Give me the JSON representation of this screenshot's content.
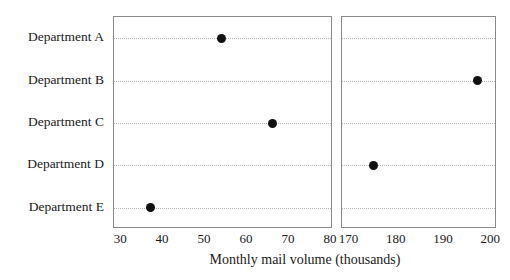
{
  "chart_data": {
    "type": "scatter",
    "subtype": "dot-plot",
    "title": "",
    "xlabel": "Monthly mail volume (thousands)",
    "ylabel": "",
    "grid": true,
    "grid_style": "dotted-horizontal",
    "legend": "none",
    "orientation": "horizontal",
    "broken_axis": true,
    "categories": [
      "Department A",
      "Department B",
      "Department C",
      "Department D",
      "Department E"
    ],
    "values": [
      54,
      197,
      66,
      175,
      37
    ],
    "points": [
      {
        "category": "Department A",
        "value": 54,
        "panel": "left"
      },
      {
        "category": "Department B",
        "value": 197,
        "panel": "right"
      },
      {
        "category": "Department C",
        "value": 66,
        "panel": "left"
      },
      {
        "category": "Department D",
        "value": 175,
        "panel": "right"
      },
      {
        "category": "Department E",
        "value": 37,
        "panel": "left"
      }
    ],
    "panels": [
      {
        "name": "left",
        "xlim": [
          28.3,
          80.5
        ],
        "ticks": [
          30,
          40,
          50,
          60,
          70,
          80
        ],
        "tick_labels": [
          "30",
          "40",
          "50",
          "60",
          "70",
          "80"
        ]
      },
      {
        "name": "right",
        "xlim": [
          168.4,
          201.2
        ],
        "ticks": [
          170,
          180,
          190,
          200
        ],
        "tick_labels": [
          "170",
          "180",
          "190",
          "200"
        ]
      }
    ],
    "colors": {
      "point": "#111111",
      "gridline": "#b9b9b9",
      "panel_border": "#8a8a8a",
      "background": "#ffffff",
      "text": "#1a1a1a"
    }
  }
}
